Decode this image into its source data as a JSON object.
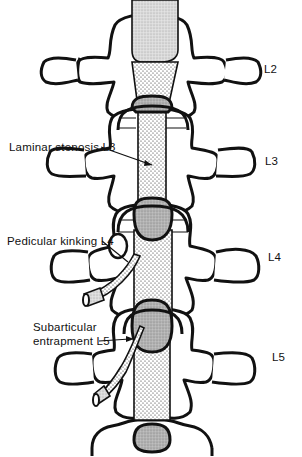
{
  "figure": {
    "vertebra_labels": [
      {
        "id": "L2",
        "text": "L2"
      },
      {
        "id": "L3",
        "text": "L3"
      },
      {
        "id": "L4",
        "text": "L4"
      },
      {
        "id": "L5",
        "text": "L5"
      }
    ],
    "annotations": [
      {
        "id": "laminar",
        "text": "Laminar stenosis L3"
      },
      {
        "id": "pedicular",
        "text": "Pedicular kinking L4"
      },
      {
        "id": "subarticular_line1",
        "text": "Subarticular"
      },
      {
        "id": "subarticular_line2",
        "text": "entrapment L5"
      }
    ],
    "colors": {
      "ink": "#111111",
      "background": "#ffffff",
      "disc_fill": "#b8b8b8",
      "stipple_dot": "#222222"
    }
  }
}
